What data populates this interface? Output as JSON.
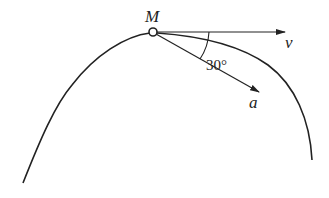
{
  "diagram": {
    "point_label": "M",
    "velocity_label": "v",
    "acceleration_label": "a",
    "angle_label": "30°",
    "colors": {
      "stroke": "#222222",
      "background": "#ffffff"
    }
  }
}
